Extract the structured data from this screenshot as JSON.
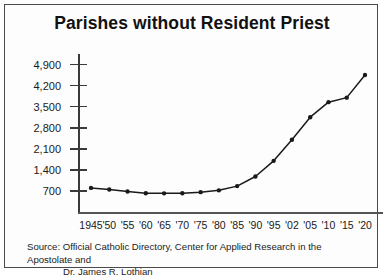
{
  "chart_data": {
    "type": "line",
    "title": "Parishes without Resident Priest",
    "xlabel": "",
    "ylabel": "",
    "categories": [
      "1945",
      "'50",
      "'55",
      "'60",
      "'65",
      "'70",
      "'75",
      "'80",
      "'85",
      "'90",
      "'95",
      "'02",
      "'05",
      "'10",
      "'15",
      "'20"
    ],
    "values": [
      800,
      750,
      680,
      625,
      620,
      625,
      660,
      720,
      860,
      1180,
      1700,
      2400,
      3150,
      3650,
      3800,
      4550
    ],
    "ylim": [
      0,
      5250
    ],
    "yticks": [
      700,
      1400,
      2100,
      2800,
      3500,
      4200,
      4900
    ],
    "ytick_labels": [
      "700",
      "1,400",
      "2,100",
      "2,800",
      "3,500",
      "4,200",
      "4,900"
    ],
    "grid": false,
    "legend": "none",
    "marker": "filled-circle",
    "line_color": "#1a1a1a",
    "axis_color": "#3a3a3a"
  },
  "source": {
    "line1": "Source: Official Catholic Directory, Center for Applied Research in the Apostolate and",
    "line2": "Dr. James R. Lothian"
  }
}
